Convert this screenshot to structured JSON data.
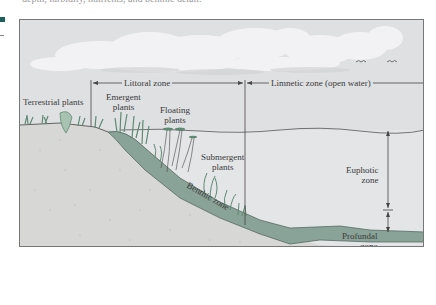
{
  "page": {
    "top_text": "depth, turbidity, nutrients, and benthic detail.",
    "margin_marker_color": "#1f5f5a"
  },
  "diagram": {
    "type": "lake cross-section zonation",
    "colors": {
      "sky": "#dfe0e2",
      "water": "#e4e5e7",
      "benthic": "#8aa398",
      "soil": "#d7d7d5",
      "plants": "#5f8a72",
      "lines": "#444444"
    },
    "horizontal_zones": {
      "littoral": "Littoral zone",
      "limnetic": "Limnetic zone (open water)"
    },
    "plant_labels": {
      "terrestrial": "Terrestrial plants",
      "emergent_1": "Emergent",
      "emergent_2": "plants",
      "floating_1": "Floating",
      "floating_2": "plants",
      "submergent_1": "Submergent",
      "submergent_2": "plants"
    },
    "vertical_zones": {
      "euphotic_1": "Euphotic",
      "euphotic_2": "zone",
      "profundal_1": "Profundal",
      "profundal_2": "zone"
    },
    "benthic_label": "Benthic zone"
  }
}
